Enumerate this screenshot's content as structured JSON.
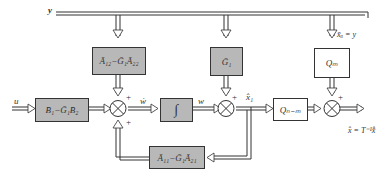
{
  "diagram": {
    "type": "block-diagram",
    "signals": {
      "y": "y",
      "u": "u",
      "w_dot": "ẇ",
      "w": "w",
      "x1_hat": "x̂₁",
      "x_ii": "x̄ᵢᵢ = y",
      "output": "x̂ = T⁻¹x̂̄"
    },
    "blocks": {
      "b_block": "B̄₁−Ḡ₁B̄₂",
      "a12_block": "Ā₁₂−Ḡ₁Ā₂₂",
      "integrator": "∫",
      "g1_block": "Ḡ₁",
      "a11_block": "Ā₁₁−Ḡ₁Ā₂₁",
      "q_n_m_block": "Qₙ₋ₘ",
      "q_m_block": "Qₘ"
    },
    "signs": {
      "plus": "+"
    },
    "colors": {
      "gray_block": "#b8b8b8",
      "line": "#333333"
    }
  }
}
